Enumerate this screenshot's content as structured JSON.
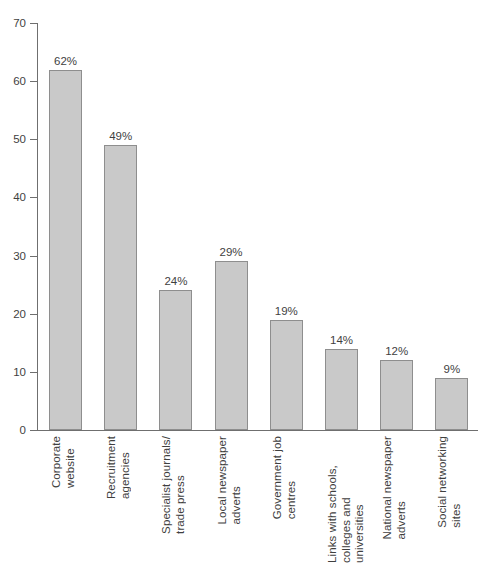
{
  "chart_data": {
    "type": "bar",
    "title": "",
    "subtitle": "",
    "xlabel": "",
    "ylabel": "",
    "ylim": [
      0,
      70
    ],
    "yticks": [
      0,
      10,
      20,
      30,
      40,
      50,
      60,
      70
    ],
    "grid": false,
    "legend": "none",
    "orientation": "vertical",
    "bar_color": "#c9c9c9",
    "bar_border_color": "#8e8e8e",
    "axis_color": "#6f6f6f",
    "text_color": "#3f3f3f",
    "categories": [
      "Corporate\nwebsite",
      "Recruitment\nagencies",
      "Specialist journals/\ntrade press",
      "Local newspaper\nadverts",
      "Government job\ncentres",
      "Links with schools,\ncolleges and universities",
      "National newspaper\nadverts",
      "Social networking\nsites"
    ],
    "values": [
      62,
      49,
      24,
      29,
      19,
      14,
      12,
      9
    ],
    "data_labels": [
      "62%",
      "49%",
      "24%",
      "29%",
      "19%",
      "14%",
      "12%",
      "9%"
    ],
    "ytick_labels": [
      "0",
      "10",
      "20",
      "30",
      "40",
      "50",
      "60",
      "70"
    ]
  }
}
